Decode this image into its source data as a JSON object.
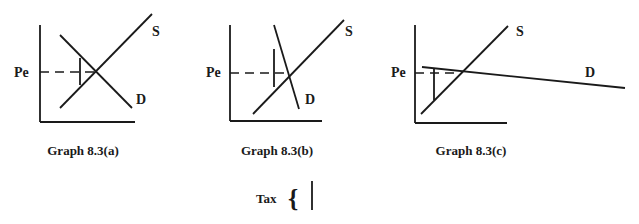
{
  "graphs": [
    {
      "id": "a",
      "title": "Graph 8.3(a)",
      "price_label": "Pe",
      "supply_label": "S",
      "demand_label": "D",
      "description": "Normal demand slope; tax burden split between buyers and sellers"
    },
    {
      "id": "b",
      "title": "Graph 8.3(b)",
      "price_label": "Pe",
      "supply_label": "S",
      "demand_label": "D",
      "description": "Inelastic (steep) demand"
    },
    {
      "id": "c",
      "title": "Graph 8.3(c)",
      "price_label": "Pe",
      "supply_label": "S",
      "demand_label": "D",
      "description": "Elastic (nearly flat) demand"
    }
  ],
  "legend": {
    "tax_label": "Tax",
    "brace": "{"
  },
  "colors": {
    "line": "#1a1a1a",
    "background": "#ffffff"
  }
}
